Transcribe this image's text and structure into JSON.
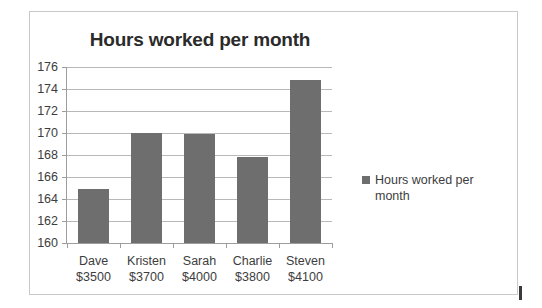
{
  "chart_data": {
    "type": "bar",
    "title": "Hours worked per month",
    "xlabel": "",
    "ylabel": "",
    "ylim": [
      160,
      176
    ],
    "ytick_step": 2,
    "yticks": [
      176,
      174,
      172,
      170,
      168,
      166,
      164,
      162,
      160
    ],
    "grid": true,
    "legend_position": "right",
    "series": [
      {
        "name": "Hours worked per month",
        "color": "#6e6e6e",
        "values": [
          164.9,
          170.0,
          169.9,
          167.8,
          174.8
        ]
      }
    ],
    "categories": [
      {
        "name": "Dave",
        "amount": "$3500"
      },
      {
        "name": "Kristen",
        "amount": "$3700"
      },
      {
        "name": "Sarah",
        "amount": "$4000"
      },
      {
        "name": "Charlie",
        "amount": "$3800"
      },
      {
        "name": "Steven",
        "amount": "$4100"
      }
    ]
  },
  "legend": {
    "label": "Hours worked per month"
  },
  "colors": {
    "bar": "#6e6e6e",
    "grid": "#b8b8b8",
    "axis": "#9d9d9d",
    "text": "#3d3d3d",
    "title": "#2b2b2b",
    "border": "#c9c9c9"
  }
}
